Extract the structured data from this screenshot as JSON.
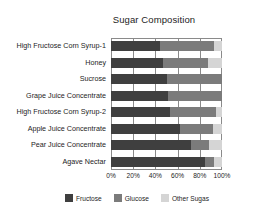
{
  "chart_data": {
    "type": "bar",
    "orientation": "horizontal",
    "stacked": true,
    "normalized": true,
    "title": "Sugar Composition",
    "xlabel": "",
    "ylabel": "",
    "xlim": [
      0,
      100
    ],
    "grid": true,
    "legend_position": "bottom",
    "xticks": [
      "0%",
      "20%",
      "40%",
      "60%",
      "80%",
      "100%"
    ],
    "xtick_values": [
      0,
      20,
      40,
      60,
      80,
      100
    ],
    "categories": [
      "High Fructose Corn Syrup-1",
      "Honey",
      "Sucrose",
      "Grape Juice Concentrate",
      "High Fructose Corn Syrup-2",
      "Apple Juice Concentrate",
      "Pear Juice Concentrate",
      "Agave Nectar"
    ],
    "series": [
      {
        "name": "Fructose",
        "color": "#3f3f3f",
        "values": [
          44,
          47,
          50,
          51,
          53,
          62,
          72,
          85
        ]
      },
      {
        "name": "Glucose",
        "color": "#7b7b7b",
        "values": [
          49,
          40,
          50,
          49,
          42,
          30,
          16,
          8
        ]
      },
      {
        "name": "Other Sugas",
        "color": "#d5d5d5",
        "values": [
          7,
          13,
          0,
          0,
          5,
          8,
          12,
          7
        ]
      }
    ]
  }
}
